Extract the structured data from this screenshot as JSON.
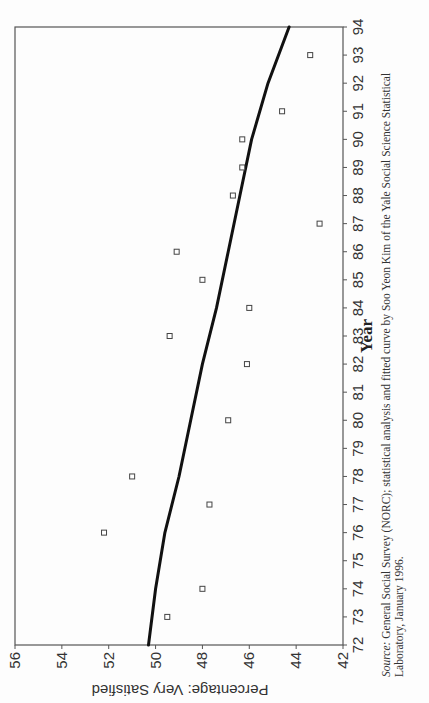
{
  "chart_data": {
    "type": "scatter",
    "title": "",
    "xlabel": "Year",
    "ylabel": "Percentage: Very Satisfied",
    "xlim": [
      72,
      94
    ],
    "ylim": [
      42,
      56
    ],
    "x_ticks": [
      "72",
      "73",
      "74",
      "75",
      "76",
      "77",
      "78",
      "79",
      "80",
      "81",
      "82",
      "83",
      "84",
      "85",
      "86",
      "87",
      "88",
      "89",
      "90",
      "91",
      "92",
      "93",
      "94"
    ],
    "y_ticks": [
      "42",
      "44",
      "46",
      "48",
      "50",
      "52",
      "54",
      "56"
    ],
    "grid": false,
    "legend": null,
    "orientation_note": "Page printed rotated 90 degrees",
    "series": [
      {
        "name": "Observed",
        "marker": "open-square",
        "points": [
          {
            "x": 73,
            "y": 49.5
          },
          {
            "x": 74,
            "y": 48.0
          },
          {
            "x": 76,
            "y": 52.2
          },
          {
            "x": 77,
            "y": 47.7
          },
          {
            "x": 78,
            "y": 51.0
          },
          {
            "x": 80,
            "y": 46.9
          },
          {
            "x": 82,
            "y": 46.1
          },
          {
            "x": 83,
            "y": 49.4
          },
          {
            "x": 84,
            "y": 46.0
          },
          {
            "x": 85,
            "y": 48.0
          },
          {
            "x": 86,
            "y": 49.1
          },
          {
            "x": 87,
            "y": 43.0
          },
          {
            "x": 88,
            "y": 46.7
          },
          {
            "x": 89,
            "y": 46.3
          },
          {
            "x": 90,
            "y": 46.3
          },
          {
            "x": 91,
            "y": 44.6
          },
          {
            "x": 93,
            "y": 43.4
          }
        ]
      },
      {
        "name": "Fitted curve",
        "style": "thick-line",
        "points": [
          {
            "x": 72,
            "y": 50.3
          },
          {
            "x": 74,
            "y": 50.0
          },
          {
            "x": 76,
            "y": 49.6
          },
          {
            "x": 78,
            "y": 49.0
          },
          {
            "x": 80,
            "y": 48.5
          },
          {
            "x": 82,
            "y": 48.0
          },
          {
            "x": 84,
            "y": 47.4
          },
          {
            "x": 86,
            "y": 46.9
          },
          {
            "x": 88,
            "y": 46.4
          },
          {
            "x": 90,
            "y": 45.9
          },
          {
            "x": 92,
            "y": 45.2
          },
          {
            "x": 94,
            "y": 44.3
          }
        ]
      }
    ]
  },
  "labels": {
    "y_axis_title": "Percentage: Very Satisfied",
    "x_axis_title": "Year",
    "top_tick_label": "56"
  },
  "caption": {
    "source_label": "Source:",
    "text": "General Social Survey (NORC); statistical analysis and fitted curve by Soo Yeon Kim of the Yale Social Science Statistical Laboratory, January 1996."
  },
  "colors": {
    "axis": "#555555",
    "curve": "#111111",
    "marker": "#444444"
  }
}
